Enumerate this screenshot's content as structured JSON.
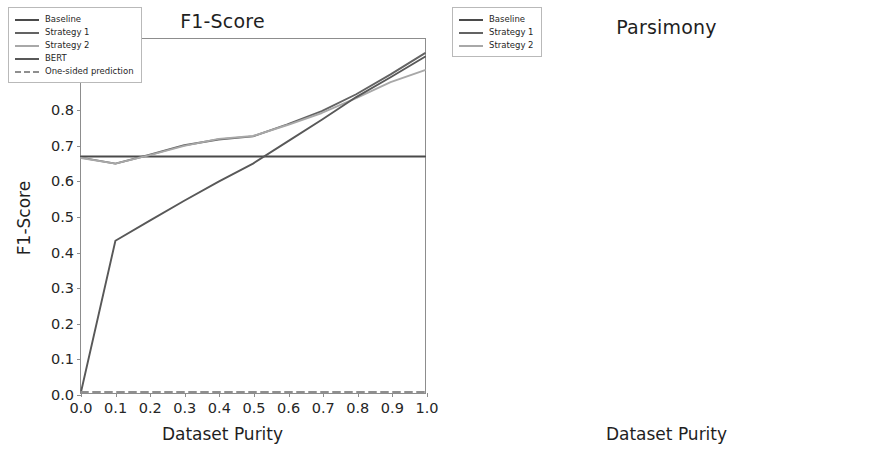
{
  "figure": {
    "width": 889,
    "height": 456,
    "background": "#ffffff"
  },
  "colors": {
    "baseline": "#4a4a4a",
    "strategy1": "#636363",
    "strategy2": "#a8a8a8",
    "bert": "#585858",
    "one_sided": "#8f8f8f",
    "axis": "#8d8d8d",
    "text": "#1f1f1f"
  },
  "chart_data": [
    {
      "panel": "left",
      "type": "line",
      "title": "F1-Score",
      "xlabel": "Dataset Purity",
      "ylabel": "F1-Score",
      "xlim": [
        0.0,
        1.0
      ],
      "ylim": [
        0.0,
        1.0
      ],
      "xticks": [
        "0.0",
        "0.1",
        "0.2",
        "0.3",
        "0.4",
        "0.5",
        "0.6",
        "0.7",
        "0.8",
        "0.9",
        "1.0"
      ],
      "yticks": [
        "0.0",
        "0.1",
        "0.2",
        "0.3",
        "0.4",
        "0.5",
        "0.6",
        "0.7",
        "0.8",
        "0.9",
        "1.0"
      ],
      "grid": false,
      "legend_position": "upper left",
      "x": [
        0.0,
        0.1,
        0.2,
        0.3,
        0.4,
        0.5,
        0.6,
        0.7,
        0.8,
        0.9,
        1.0
      ],
      "series": [
        {
          "name": "Baseline",
          "color": "#4a4a4a",
          "style": "solid",
          "values": [
            0.668,
            0.668,
            0.668,
            0.668,
            0.668,
            0.668,
            0.668,
            0.668,
            0.668,
            0.668,
            0.668
          ]
        },
        {
          "name": "Strategy 1",
          "color": "#636363",
          "style": "solid",
          "values": [
            0.665,
            0.648,
            0.673,
            0.7,
            0.716,
            0.725,
            0.759,
            0.796,
            0.844,
            0.9,
            0.96
          ]
        },
        {
          "name": "Strategy 2",
          "color": "#a8a8a8",
          "style": "solid",
          "values": [
            0.664,
            0.648,
            0.672,
            0.698,
            0.718,
            0.726,
            0.757,
            0.791,
            0.833,
            0.878,
            0.912
          ]
        },
        {
          "name": "BERT",
          "color": "#585858",
          "style": "solid",
          "values": [
            0.003,
            0.43,
            0.487,
            0.543,
            0.597,
            0.648,
            0.71,
            0.772,
            0.836,
            0.892,
            0.95
          ]
        },
        {
          "name": "One-sided prediction",
          "color": "#8f8f8f",
          "style": "dashed",
          "values": [
            0.003,
            0.003,
            0.003,
            0.003,
            0.003,
            0.003,
            0.003,
            0.003,
            0.003,
            0.003,
            0.003
          ]
        }
      ]
    },
    {
      "panel": "right",
      "type": "line",
      "title": "Parsimony",
      "xlabel": "Dataset Purity",
      "ylabel": "Parsimony Score",
      "xlim": [
        0.0,
        1.0
      ],
      "ylim": [
        0,
        3000
      ],
      "xticks": [
        "0.0",
        "0.1",
        "0.2",
        "0.3",
        "0.4",
        "0.5",
        "0.6",
        "0.7",
        "0.8",
        "0.9",
        "1.0"
      ],
      "yticks": [
        "0",
        "300",
        "600",
        "900",
        "1200",
        "1500",
        "1800",
        "2100",
        "2400",
        "2700",
        "3000"
      ],
      "grid": false,
      "legend_position": "upper left",
      "x": [
        0.0,
        0.1,
        0.2,
        0.3,
        0.4,
        0.5,
        0.6,
        0.7,
        0.8,
        0.9,
        1.0
      ],
      "series": [
        {
          "name": "Baseline",
          "color": "#4a4a4a",
          "style": "solid",
          "values": [
            110,
            110,
            110,
            110,
            110,
            110,
            110,
            110,
            110,
            110,
            110
          ]
        },
        {
          "name": "Strategy 1",
          "color": "#636363",
          "style": "solid",
          "values": [
            2020,
            2220,
            2215,
            2310,
            2455,
            2470,
            2580,
            2690,
            2810,
            2860,
            2930
          ]
        },
        {
          "name": "Strategy 2",
          "color": "#a8a8a8",
          "style": "solid",
          "values": [
            110,
            112,
            160,
            185,
            195,
            225,
            235,
            228,
            220,
            222,
            205
          ]
        }
      ]
    }
  ],
  "legends": {
    "left": [
      {
        "label": "Baseline",
        "color": "#4a4a4a",
        "style": "solid"
      },
      {
        "label": "Strategy 1",
        "color": "#636363",
        "style": "solid"
      },
      {
        "label": "Strategy 2",
        "color": "#a8a8a8",
        "style": "solid"
      },
      {
        "label": "BERT",
        "color": "#585858",
        "style": "solid"
      },
      {
        "label": "One-sided prediction",
        "color": "#8f8f8f",
        "style": "dashed"
      }
    ],
    "right": [
      {
        "label": "Baseline",
        "color": "#4a4a4a",
        "style": "solid"
      },
      {
        "label": "Strategy 1",
        "color": "#636363",
        "style": "solid"
      },
      {
        "label": "Strategy 2",
        "color": "#a8a8a8",
        "style": "solid"
      }
    ]
  }
}
